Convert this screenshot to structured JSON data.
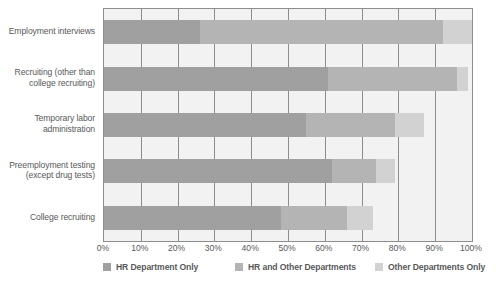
{
  "chart_data": {
    "type": "bar",
    "subtype": "horizontal-stacked",
    "title": "",
    "xlabel": "",
    "ylabel": "",
    "xlim": [
      0,
      100
    ],
    "xticks": [
      "0%",
      "10%",
      "20%",
      "30%",
      "40%",
      "50%",
      "60%",
      "70%",
      "80%",
      "90%",
      "100%"
    ],
    "xtick_values": [
      0,
      10,
      20,
      30,
      40,
      50,
      60,
      70,
      80,
      90,
      100
    ],
    "grid": true,
    "legend_position": "bottom",
    "categories": [
      "Employment interviews",
      "Recruiting (other than college recruiting)",
      "Temporary labor administration",
      "Preemployment testing (except drug tests)",
      "College recruiting"
    ],
    "category_lines": [
      [
        "Employment interviews"
      ],
      [
        "Recruiting (other than",
        "college recruiting)"
      ],
      [
        "Temporary labor",
        "administration"
      ],
      [
        "Preemployment testing",
        "(except drug tests)"
      ],
      [
        "College recruiting"
      ]
    ],
    "series": [
      {
        "name": "HR Department Only",
        "color": "#a0a0a0",
        "values": [
          26,
          61,
          55,
          62,
          48
        ]
      },
      {
        "name": "HR and Other Departments",
        "color": "#b4b4b4",
        "values": [
          66,
          35,
          24,
          12,
          18
        ]
      },
      {
        "name": "Other Departments Only",
        "color": "#d2d2d2",
        "values": [
          8,
          3,
          8,
          5,
          7
        ]
      }
    ]
  },
  "legend": {
    "items": [
      {
        "label": "HR Department Only",
        "color": "#a0a0a0"
      },
      {
        "label": "HR and Other Departments",
        "color": "#b4b4b4"
      },
      {
        "label": "Other Departments Only",
        "color": "#d2d2d2"
      }
    ]
  },
  "colors": {
    "hr_only": "#a0a0a0",
    "hr_and_other": "#b4b4b4",
    "other_only": "#d2d2d2",
    "plot_background": "#f2f2f2",
    "axis": "#8d8d8d",
    "text": "#58595b"
  }
}
